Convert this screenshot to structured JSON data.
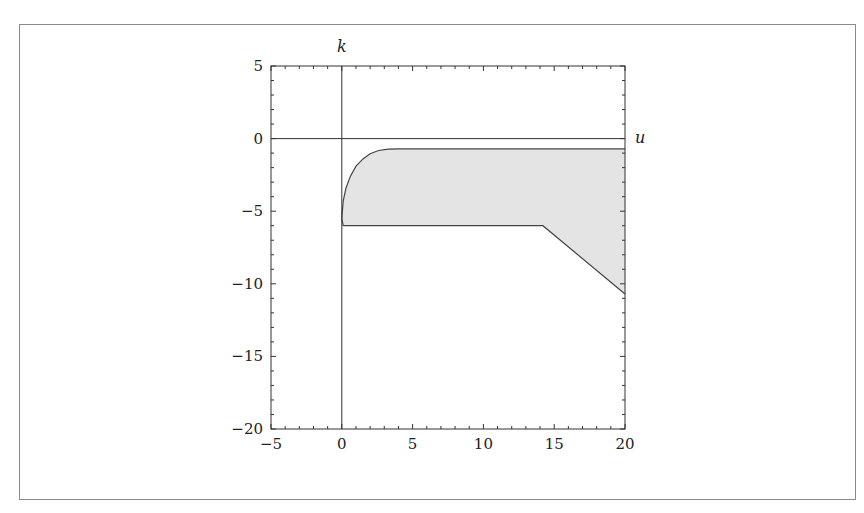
{
  "chart_data": {
    "type": "area",
    "title": "",
    "xlabel": "u",
    "ylabel": "k",
    "xlim": [
      -5,
      20
    ],
    "ylim": [
      -20,
      5
    ],
    "xticks": [
      -5,
      0,
      5,
      10,
      15,
      20
    ],
    "yticks": [
      5,
      0,
      -5,
      -10,
      -15,
      -20
    ],
    "xtick_labels": [
      "−5",
      "0",
      "5",
      "10",
      "15",
      "20"
    ],
    "ytick_labels": [
      "5",
      "0",
      "−5",
      "−10",
      "−15",
      "−20"
    ],
    "minor_tick_step": 1,
    "grid": false,
    "legend": null,
    "axes_lines": {
      "x_at": 0,
      "y_at": 0
    },
    "region": {
      "name": "shaded-region",
      "fill": "#e4e4e4",
      "stroke": "#444444",
      "upper_boundary": [
        [
          0,
          -5.5
        ],
        [
          0.1,
          -4.3
        ],
        [
          0.3,
          -3.4
        ],
        [
          0.6,
          -2.6
        ],
        [
          1.0,
          -1.9
        ],
        [
          1.5,
          -1.4
        ],
        [
          2.0,
          -1.05
        ],
        [
          2.6,
          -0.82
        ],
        [
          3.3,
          -0.72
        ],
        [
          4.0,
          -0.7
        ],
        [
          20,
          -0.7
        ]
      ],
      "lower_boundary": [
        [
          0,
          -5.5
        ],
        [
          0.1,
          -6.0
        ],
        [
          14.2,
          -6.0
        ],
        [
          20,
          -10.7
        ]
      ]
    }
  }
}
